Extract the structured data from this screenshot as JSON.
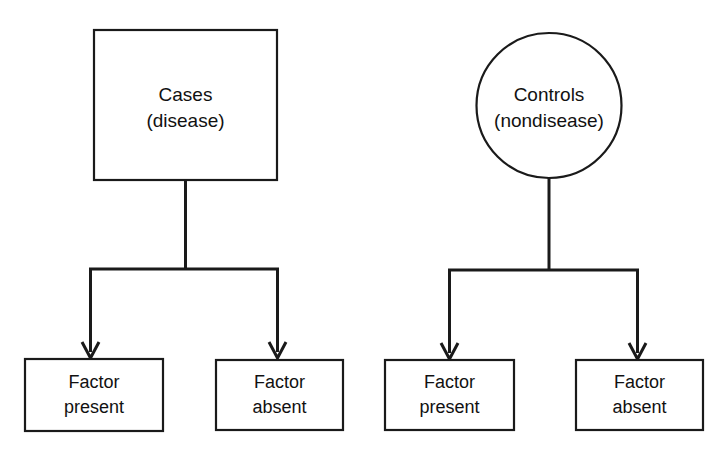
{
  "diagram": {
    "colors": {
      "background": "#ffffff",
      "stroke": "#1a1a1a",
      "text": "#111111",
      "shape_fill": "#ffffff"
    },
    "branches": [
      {
        "id": "cases-branch",
        "root": {
          "shape": "rectangle",
          "line1": "Cases",
          "line2": "(disease)"
        },
        "children": [
          {
            "line1": "Factor",
            "line2": "present"
          },
          {
            "line1": "Factor",
            "line2": "absent"
          }
        ]
      },
      {
        "id": "controls-branch",
        "root": {
          "shape": "circle",
          "line1": "Controls",
          "line2": "(nondisease)"
        },
        "children": [
          {
            "line1": "Factor",
            "line2": "present"
          },
          {
            "line1": "Factor",
            "line2": "absent"
          }
        ]
      }
    ]
  }
}
